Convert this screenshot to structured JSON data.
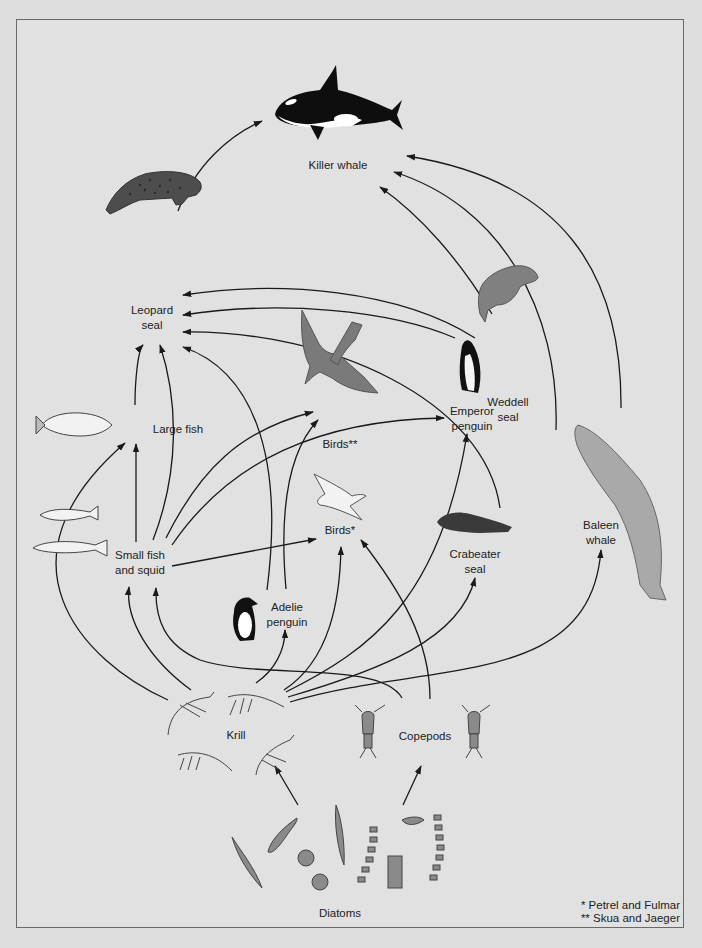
{
  "diagram": {
    "background_color": "#e1e1e1",
    "line_color": "#1a1a1a",
    "nodes": [
      {
        "id": "killer_whale",
        "label": "Killer whale",
        "x": 338,
        "y": 158
      },
      {
        "id": "leopard_seal",
        "label": "Leopard\nseal",
        "x": 152,
        "y": 303
      },
      {
        "id": "weddell_seal",
        "label": "Weddell\nseal",
        "x": 508,
        "y": 395
      },
      {
        "id": "large_fish",
        "label": "Large fish",
        "x": 178,
        "y": 422
      },
      {
        "id": "birds_skua",
        "label": "Birds**",
        "x": 340,
        "y": 437
      },
      {
        "id": "emperor_penguin",
        "label": "Emperor\npenguin",
        "x": 472,
        "y": 404
      },
      {
        "id": "small_fish_squid",
        "label": "Small fish\nand squid",
        "x": 140,
        "y": 548
      },
      {
        "id": "birds_petrel",
        "label": "Birds*",
        "x": 340,
        "y": 523
      },
      {
        "id": "crabeater_seal",
        "label": "Crabeater\nseal",
        "x": 475,
        "y": 547
      },
      {
        "id": "baleen_whale",
        "label": "Baleen\nwhale",
        "x": 601,
        "y": 518
      },
      {
        "id": "adelie_penguin",
        "label": "Adelie\npenguin",
        "x": 287,
        "y": 600
      },
      {
        "id": "krill",
        "label": "Krill",
        "x": 236,
        "y": 728
      },
      {
        "id": "copepods",
        "label": "Copepods",
        "x": 425,
        "y": 729
      },
      {
        "id": "diatoms",
        "label": "Diatoms",
        "x": 340,
        "y": 906
      }
    ],
    "edges": [
      {
        "from": "leopard_seal",
        "to": "killer_whale"
      },
      {
        "from": "weddell_seal",
        "to": "killer_whale"
      },
      {
        "from": "crabeater_seal",
        "to": "killer_whale"
      },
      {
        "from": "baleen_whale",
        "to": "killer_whale"
      },
      {
        "from": "weddell_seal",
        "to": "leopard_seal"
      },
      {
        "from": "emperor_penguin",
        "to": "leopard_seal"
      },
      {
        "from": "crabeater_seal",
        "to": "leopard_seal"
      },
      {
        "from": "adelie_penguin",
        "to": "leopard_seal"
      },
      {
        "from": "large_fish",
        "to": "leopard_seal"
      },
      {
        "from": "small_fish_squid",
        "to": "leopard_seal"
      },
      {
        "from": "small_fish_squid",
        "to": "large_fish"
      },
      {
        "from": "small_fish_squid",
        "to": "birds_skua"
      },
      {
        "from": "small_fish_squid",
        "to": "emperor_penguin"
      },
      {
        "from": "small_fish_squid",
        "to": "birds_petrel"
      },
      {
        "from": "adelie_penguin",
        "to": "birds_skua"
      },
      {
        "from": "krill",
        "to": "large_fish"
      },
      {
        "from": "krill",
        "to": "small_fish_squid"
      },
      {
        "from": "krill",
        "to": "adelie_penguin"
      },
      {
        "from": "krill",
        "to": "birds_petrel"
      },
      {
        "from": "krill",
        "to": "emperor_penguin"
      },
      {
        "from": "krill",
        "to": "crabeater_seal"
      },
      {
        "from": "krill",
        "to": "baleen_whale"
      },
      {
        "from": "copepods",
        "to": "small_fish_squid"
      },
      {
        "from": "copepods",
        "to": "birds_petrel"
      },
      {
        "from": "diatoms",
        "to": "krill"
      },
      {
        "from": "diatoms",
        "to": "copepods"
      }
    ],
    "footnotes": [
      "* Petrel and Fulmar",
      "** Skua and Jaeger"
    ]
  },
  "icons": {
    "killer_whale": "orca-icon",
    "leopard_seal": "leopard-seal-icon",
    "weddell_seal": "weddell-seal-icon",
    "large_fish": "fish-icon",
    "birds_skua": "skua-bird-icon",
    "emperor_penguin": "emperor-penguin-icon",
    "small_fish_squid": "small-fish-icon",
    "birds_petrel": "petrel-bird-icon",
    "crabeater_seal": "crabeater-seal-icon",
    "baleen_whale": "baleen-whale-icon",
    "adelie_penguin": "adelie-penguin-icon",
    "krill": "krill-icon",
    "copepods": "copepod-icon",
    "diatoms": "diatom-icon"
  }
}
